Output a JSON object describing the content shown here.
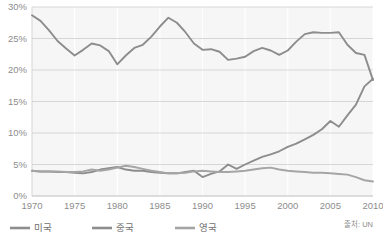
{
  "chart_data": {
    "type": "line",
    "title": "",
    "subtitle": "",
    "xlabel": "",
    "ylabel": "",
    "xlim": [
      1970,
      2010
    ],
    "ylim": [
      0,
      30
    ],
    "grid": "horizontal",
    "legend_position": "bottom",
    "source_note": "출처: UN",
    "x_tick_labels": [
      "1970",
      "1975",
      "1980",
      "1985",
      "1990",
      "1995",
      "2000",
      "2005",
      "2010"
    ],
    "x_ticks": [
      1970,
      1975,
      1980,
      1985,
      1990,
      1995,
      2000,
      2005,
      2010
    ],
    "y_tick_labels": [
      "0%",
      "5%",
      "10%",
      "15%",
      "20%",
      "25%",
      "30%"
    ],
    "y_ticks": [
      0,
      5,
      10,
      15,
      20,
      25,
      30
    ],
    "x": [
      1970,
      1971,
      1972,
      1973,
      1974,
      1975,
      1976,
      1977,
      1978,
      1979,
      1980,
      1981,
      1982,
      1983,
      1984,
      1985,
      1986,
      1987,
      1988,
      1989,
      1990,
      1991,
      1992,
      1993,
      1994,
      1995,
      1996,
      1997,
      1998,
      1999,
      2000,
      2001,
      2002,
      2003,
      2004,
      2005,
      2006,
      2007,
      2008,
      2009,
      2010
    ],
    "series": [
      {
        "name": "미국",
        "color": "#8d8d8d",
        "values": [
          28.7,
          27.8,
          26.3,
          24.6,
          23.4,
          22.3,
          23.2,
          24.2,
          23.9,
          23.0,
          20.9,
          22.3,
          23.5,
          24.0,
          25.3,
          26.9,
          28.3,
          27.5,
          26.0,
          24.2,
          23.2,
          23.3,
          22.9,
          21.6,
          21.8,
          22.1,
          23.0,
          23.5,
          23.1,
          22.4,
          23.1,
          24.5,
          25.7,
          26.0,
          25.9,
          25.9,
          26.0,
          24.0,
          22.7,
          22.4,
          18.4
        ]
      },
      {
        "name": "중국",
        "color": "#8d8d8d",
        "values": [
          4.0,
          3.9,
          3.9,
          3.8,
          3.8,
          3.7,
          3.6,
          3.8,
          4.2,
          4.4,
          4.6,
          4.2,
          4.0,
          4.0,
          3.8,
          3.7,
          3.6,
          3.6,
          3.8,
          4.0,
          3.0,
          3.5,
          3.9,
          5.0,
          4.3,
          5.0,
          5.6,
          6.2,
          6.6,
          7.1,
          7.8,
          8.3,
          9.0,
          9.7,
          10.6,
          11.9,
          11.0,
          12.8,
          14.5,
          17.4,
          18.6
        ]
      },
      {
        "name": "영국",
        "color": "#a5a5a5",
        "values": [
          4.0,
          3.9,
          3.9,
          3.9,
          3.8,
          3.8,
          3.9,
          4.2,
          4.0,
          4.2,
          4.5,
          4.8,
          4.6,
          4.3,
          4.0,
          3.8,
          3.6,
          3.6,
          3.7,
          3.9,
          4.0,
          3.9,
          3.8,
          3.8,
          3.9,
          4.0,
          4.2,
          4.4,
          4.5,
          4.2,
          4.0,
          3.9,
          3.8,
          3.7,
          3.7,
          3.6,
          3.5,
          3.4,
          3.0,
          2.5,
          2.3
        ]
      }
    ]
  },
  "legend": {
    "items": [
      {
        "label": "미국"
      },
      {
        "label": "중국"
      },
      {
        "label": "영국"
      }
    ]
  },
  "footer": {
    "source": "출처: UN"
  }
}
